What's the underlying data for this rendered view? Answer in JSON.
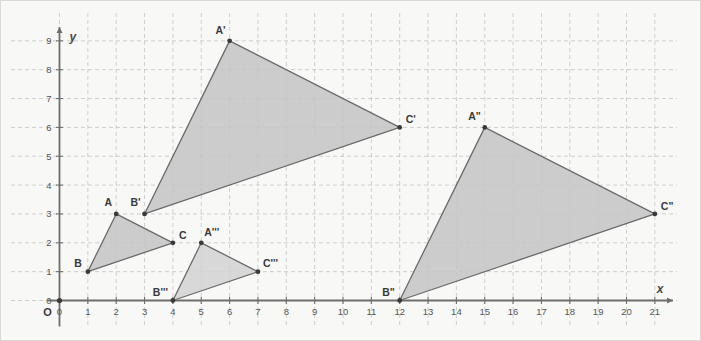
{
  "figure": {
    "title": "",
    "background_color": "#f8f8f6",
    "border_color": "#d8d8d4"
  },
  "axes": {
    "x_axis_name": "x",
    "y_axis_name": "y",
    "origin_label": "O",
    "origin_x_tick": "0",
    "origin_y_tick": "0",
    "x_ticks": [
      "0",
      "1",
      "2",
      "3",
      "4",
      "5",
      "6",
      "7",
      "8",
      "9",
      "10",
      "11",
      "12",
      "13",
      "14",
      "15",
      "16",
      "17",
      "18",
      "19",
      "20",
      "21"
    ],
    "y_ticks": [
      "0",
      "1",
      "2",
      "3",
      "4",
      "5",
      "6",
      "7",
      "8",
      "9"
    ],
    "axis_color": "#6e6e6e",
    "grid_color": "#9a9aa0",
    "grid_style": "dashed"
  },
  "chart_data": {
    "type": "scatter",
    "title": "",
    "xlabel": "x",
    "ylabel": "y",
    "xlim": [
      0,
      21.6
    ],
    "ylim": [
      0,
      9.6
    ],
    "x_tick_values": [
      0,
      1,
      2,
      3,
      4,
      5,
      6,
      7,
      8,
      9,
      10,
      11,
      12,
      13,
      14,
      15,
      16,
      17,
      18,
      19,
      20,
      21
    ],
    "y_tick_values": [
      0,
      1,
      2,
      3,
      4,
      5,
      6,
      7,
      8,
      9
    ],
    "grid": true,
    "legend": "none",
    "shapes": [
      {
        "name": "triangle-ABC",
        "fill": "#c4c4c4",
        "stroke": "#6a6a6a",
        "points": [
          {
            "label": "A",
            "x": 2,
            "y": 3,
            "label_dx": -4,
            "label_dy": -8,
            "anchor": "end"
          },
          {
            "label": "B",
            "x": 1,
            "y": 1,
            "label_dx": -6,
            "label_dy": -5,
            "anchor": "end"
          },
          {
            "label": "C",
            "x": 4,
            "y": 2,
            "label_dx": 6,
            "label_dy": -4,
            "anchor": "start"
          }
        ]
      },
      {
        "name": "triangle-A-prime-B-prime-C-prime",
        "fill": "#c4c4c4",
        "stroke": "#6a6a6a",
        "points": [
          {
            "label": "A'",
            "x": 6,
            "y": 9,
            "label_dx": -4,
            "label_dy": -7,
            "anchor": "end"
          },
          {
            "label": "B'",
            "x": 3,
            "y": 3,
            "label_dx": -4,
            "label_dy": -8,
            "anchor": "end"
          },
          {
            "label": "C'",
            "x": 12,
            "y": 6,
            "label_dx": 6,
            "label_dy": -4,
            "anchor": "start"
          }
        ]
      },
      {
        "name": "triangle-A-double-prime-B-double-prime-C-double-prime",
        "fill": "#c4c4c4",
        "stroke": "#6a6a6a",
        "points": [
          {
            "label": "A\"",
            "x": 15,
            "y": 6,
            "label_dx": -4,
            "label_dy": -7,
            "anchor": "end"
          },
          {
            "label": "B\"",
            "x": 12,
            "y": 0,
            "label_dx": -5,
            "label_dy": -5,
            "anchor": "end"
          },
          {
            "label": "C\"",
            "x": 21,
            "y": 3,
            "label_dx": 6,
            "label_dy": -4,
            "anchor": "start"
          }
        ]
      },
      {
        "name": "triangle-A-triple-prime-B-triple-prime-C-triple-prime",
        "fill": "#d2d2d2",
        "stroke": "#6a6a6a",
        "points": [
          {
            "label": "A'''",
            "x": 5,
            "y": 2,
            "label_dx": 3,
            "label_dy": -7,
            "anchor": "start"
          },
          {
            "label": "B'''",
            "x": 4,
            "y": 0,
            "label_dx": -5,
            "label_dy": -5,
            "anchor": "end"
          },
          {
            "label": "C'''",
            "x": 7,
            "y": 1,
            "label_dx": 5,
            "label_dy": -5,
            "anchor": "start"
          }
        ]
      }
    ]
  }
}
